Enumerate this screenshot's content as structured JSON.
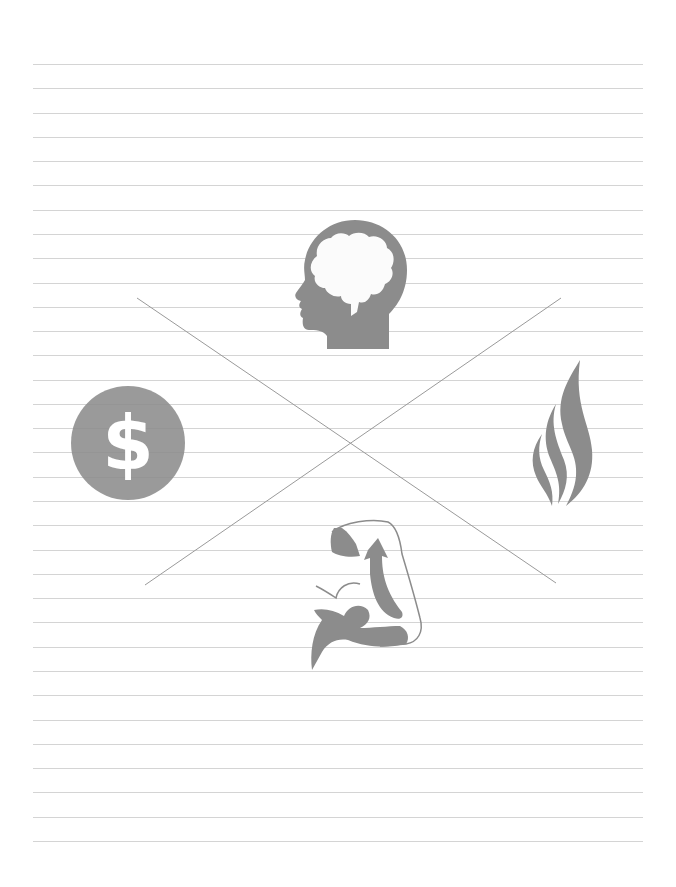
{
  "page": {
    "type": "ruled-notebook-page",
    "background": "#ffffff",
    "line_color": "#d4d4d4",
    "line_count": 33,
    "line_start_y": 64,
    "line_spacing": 24.28,
    "line_x_start": 33,
    "line_x_end": 643
  },
  "diagram": {
    "cross_color": "#9a9a9a",
    "icon_color": "#8c8c8c",
    "cross_lines": [
      {
        "x1": 137,
        "y1": 298,
        "x2": 556,
        "y2": 583
      },
      {
        "x1": 561,
        "y1": 298,
        "x2": 145,
        "y2": 585
      }
    ],
    "quadrants": {
      "top": {
        "icon": "brain-head-icon",
        "meaning": "mind"
      },
      "left": {
        "icon": "dollar-icon",
        "meaning": "money",
        "glyph": "$"
      },
      "right": {
        "icon": "flame-icon",
        "meaning": "spirit"
      },
      "bottom": {
        "icon": "flexed-arm-icon",
        "meaning": "body"
      }
    }
  }
}
